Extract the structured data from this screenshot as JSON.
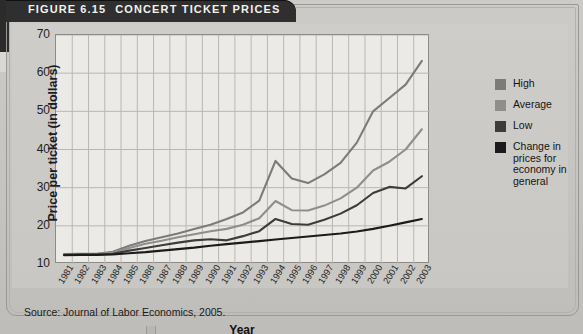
{
  "figure": {
    "number_label": "FIGURE 6.15",
    "title": "CONCERT TICKET PRICES",
    "source": "Source: Journal of Labor Economics, 2005."
  },
  "legend": {
    "items": [
      {
        "label": "High",
        "color": "#7b7b79"
      },
      {
        "label": "Average",
        "color": "#8e8e8c"
      },
      {
        "label": "Low",
        "color": "#3c3c3b"
      },
      {
        "label": "Change in prices for economy in general",
        "color": "#1b1b1b"
      }
    ]
  },
  "chart_data": {
    "type": "line",
    "title": "CONCERT TICKET PRICES",
    "xlabel": "Year",
    "ylabel": "Price per ticket (in dollars)",
    "ylim": [
      10,
      70
    ],
    "yticks": [
      10,
      20,
      30,
      40,
      50,
      60,
      70
    ],
    "grid": true,
    "legend_position": "right",
    "categories": [
      "1981",
      "1982",
      "1983",
      "1984",
      "1985",
      "1986",
      "1987",
      "1988",
      "1989",
      "1990",
      "1991",
      "1992",
      "1993",
      "1994",
      "1995",
      "1996",
      "1997",
      "1998",
      "1999",
      "2000",
      "2001",
      "2002",
      "2003"
    ],
    "series": [
      {
        "name": "High",
        "color": "#7b7b79",
        "values": [
          12.6,
          12.7,
          12.7,
          13.2,
          14.8,
          16.0,
          17.0,
          18.0,
          19.2,
          20.3,
          21.8,
          23.5,
          26.6,
          37.0,
          32.4,
          31.2,
          33.5,
          36.5,
          41.8,
          50.0,
          53.5,
          57.0,
          63.2
        ]
      },
      {
        "name": "Average",
        "color": "#8e8e8c",
        "values": [
          12.5,
          12.6,
          12.6,
          13.0,
          14.2,
          15.3,
          16.1,
          17.0,
          17.8,
          18.6,
          19.2,
          20.3,
          22.0,
          26.5,
          24.1,
          24.0,
          25.3,
          27.2,
          30.0,
          34.5,
          36.8,
          40.0,
          45.3
        ]
      },
      {
        "name": "Low",
        "color": "#3c3c3b",
        "values": [
          12.4,
          12.5,
          12.5,
          12.7,
          13.5,
          14.2,
          14.9,
          15.6,
          16.2,
          16.5,
          16.2,
          17.3,
          18.6,
          21.8,
          20.5,
          20.3,
          21.6,
          23.2,
          25.4,
          28.6,
          30.2,
          29.8,
          33.0
        ]
      },
      {
        "name": "Change in prices for economy in general",
        "color": "#1b1b1b",
        "values": [
          12.3,
          12.4,
          12.4,
          12.5,
          12.8,
          13.1,
          13.5,
          13.9,
          14.3,
          14.8,
          15.2,
          15.6,
          16.0,
          16.4,
          16.8,
          17.2,
          17.6,
          18.0,
          18.5,
          19.2,
          20.0,
          20.9,
          21.8
        ]
      }
    ]
  }
}
